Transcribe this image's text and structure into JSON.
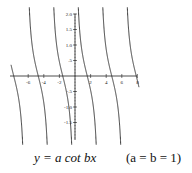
{
  "chart_data": {
    "type": "line",
    "title": "",
    "function": "y = cot x",
    "xlabel": "",
    "ylabel": "",
    "xlim": [
      -8,
      8
    ],
    "ylim": [
      -2.0,
      2.0
    ],
    "x_ticks": [
      "-6",
      "-4",
      "-2",
      "2",
      "4",
      "6",
      "8"
    ],
    "y_ticks": [
      "2.0",
      "1.5",
      "1.0",
      ".5",
      "-.5",
      "-1.0",
      "-1.5"
    ],
    "grid": false,
    "series": [
      {
        "name": "y = a cot bx (a = b = 1)",
        "x": [
          -7.85,
          -4.71,
          -1.57,
          1.57,
          4.71,
          7.85
        ],
        "values": [
          0,
          0,
          0,
          0,
          0,
          0
        ],
        "note": "zero crossings; branches between asymptotes at x = kπ"
      }
    ]
  },
  "caption": {
    "equation": "y = a cot bx",
    "params": "(a = b = 1)"
  },
  "axis_color": "#222222",
  "curve_color": "#222222"
}
